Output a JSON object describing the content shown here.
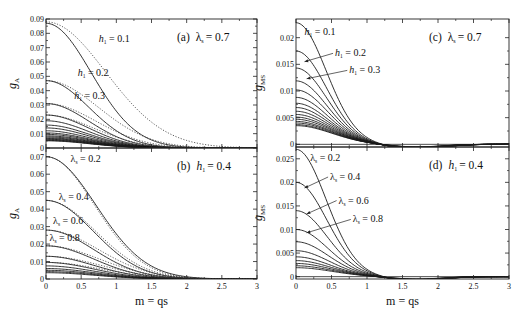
{
  "chart_data": [
    {
      "id": "a",
      "type": "line",
      "title": "(a)  λs = 0.7",
      "title_parts": {
        "tag": "(a)",
        "param": "λ",
        "sub": "s",
        "value": "= 0.7"
      },
      "ylabel": "g",
      "ylabel_sub": "A",
      "xlabel": "",
      "xlim": [
        0,
        3
      ],
      "ylim": [
        0,
        0.09
      ],
      "xticks": [
        0,
        0.5,
        1,
        1.5,
        2,
        2.5,
        3
      ],
      "yticks": [
        0,
        0.01,
        0.02,
        0.03,
        0.04,
        0.05,
        0.06,
        0.07,
        0.08,
        0.09
      ],
      "ytick_labels": [
        "0",
        "0.01",
        "0.02",
        "0.03",
        "0.04",
        "0.05",
        "0.06",
        "0.07",
        "0.08",
        "0.09"
      ],
      "show_xtick_labels": false,
      "grid": false,
      "family_param": "h1",
      "solid_series": [
        {
          "name": "h1 = 0.1",
          "y0": 0.087,
          "width": 0.95
        },
        {
          "name": "h1 = 0.2",
          "y0": 0.047,
          "width": 0.9
        },
        {
          "name": "h1 = 0.3",
          "y0": 0.031,
          "width": 0.9
        },
        {
          "name": "h1 = 0.4",
          "y0": 0.023,
          "width": 0.9
        },
        {
          "name": "h1 = 0.5",
          "y0": 0.019,
          "width": 0.9
        },
        {
          "name": "h1 = 0.6",
          "y0": 0.016,
          "width": 0.9
        },
        {
          "name": "h1 = 0.7",
          "y0": 0.014,
          "width": 0.9
        },
        {
          "name": "h1 = 0.8",
          "y0": 0.012,
          "width": 0.9
        },
        {
          "name": "h1 = 0.9",
          "y0": 0.0105,
          "width": 0.9
        },
        {
          "name": "h1 = 1.0",
          "y0": 0.0095,
          "width": 0.9
        },
        {
          "name": "h1 = 1.1",
          "y0": 0.0085,
          "width": 0.9
        },
        {
          "name": "h1 = 1.2",
          "y0": 0.0078,
          "width": 0.9
        },
        {
          "name": "h1 = 1.3",
          "y0": 0.0071,
          "width": 0.9
        },
        {
          "name": "h1 = 1.4",
          "y0": 0.0066,
          "width": 0.9
        },
        {
          "name": "h1 = 1.5",
          "y0": 0.0061,
          "width": 0.9
        },
        {
          "name": "h1 = 1.6",
          "y0": 0.0057,
          "width": 0.9
        },
        {
          "name": "h1 = 1.7",
          "y0": 0.0053,
          "width": 0.9
        },
        {
          "name": "h1 = 1.8",
          "y0": 0.005,
          "width": 0.9
        }
      ],
      "dotted_series": [
        {
          "name": "h1 = 0.1 (approx.)",
          "y0": 0.088,
          "width": 1.25
        },
        {
          "name": "h1 = 0.2 (approx.)",
          "y0": 0.047,
          "width": 1.1
        },
        {
          "name": "h1 = 0.3 (approx.)",
          "y0": 0.031,
          "width": 1.05
        },
        {
          "name": "h1 = 0.4 (approx.)",
          "y0": 0.023,
          "width": 1.0
        }
      ],
      "annotations": [
        {
          "text_main": "h",
          "text_sub": "1",
          "text_value": " = 0.1",
          "x": 0.75,
          "y": 0.074
        },
        {
          "text_main": "h",
          "text_sub": "1",
          "text_value": " = 0.2",
          "x": 0.45,
          "y": 0.05
        },
        {
          "text_main": "h",
          "text_sub": "1",
          "text_value": " = 0.3",
          "x": 0.4,
          "y": 0.034
        }
      ]
    },
    {
      "id": "b",
      "type": "line",
      "title": "(b)  h1 = 0.4",
      "title_parts": {
        "tag": "(b)",
        "param": "h",
        "sub": "1",
        "value": "= 0.4"
      },
      "ylabel": "g",
      "ylabel_sub": "A",
      "xlabel": "m = qs",
      "xlim": [
        0,
        3
      ],
      "ylim": [
        0,
        0.075
      ],
      "xticks": [
        0,
        0.5,
        1,
        1.5,
        2,
        2.5,
        3
      ],
      "xtick_labels": [
        "0",
        "0.5",
        "1",
        "1.5",
        "2",
        "2.5",
        "3"
      ],
      "yticks": [
        0,
        0.01,
        0.02,
        0.03,
        0.04,
        0.05,
        0.06,
        0.07
      ],
      "ytick_labels": [
        "0",
        "0.01",
        "0.02",
        "0.03",
        "0.04",
        "0.05",
        "0.06",
        "0.07"
      ],
      "show_xtick_labels": true,
      "grid": false,
      "family_param": "λs",
      "solid_series": [
        {
          "name": "λs = 0.2",
          "y0": 0.07,
          "width": 1.05
        },
        {
          "name": "λs = 0.4",
          "y0": 0.045,
          "width": 1.0
        },
        {
          "name": "λs = 0.6",
          "y0": 0.028,
          "width": 1.0
        },
        {
          "name": "λs = 0.8",
          "y0": 0.019,
          "width": 1.0
        },
        {
          "name": "λs = 1.0",
          "y0": 0.013,
          "width": 1.0
        },
        {
          "name": "λs = 1.2",
          "y0": 0.0095,
          "width": 1.0
        },
        {
          "name": "λs = 1.4",
          "y0": 0.0075,
          "width": 1.0
        },
        {
          "name": "λs = 1.6",
          "y0": 0.006,
          "width": 1.0
        },
        {
          "name": "λs = 1.8",
          "y0": 0.005,
          "width": 1.0
        },
        {
          "name": "λs = 2.0",
          "y0": 0.0042,
          "width": 1.0
        },
        {
          "name": "λs = 2.2",
          "y0": 0.0036,
          "width": 1.0
        }
      ],
      "dotted_series": [
        {
          "name": "λs = 0.2 (approx.)",
          "y0": 0.07,
          "width": 1.02
        },
        {
          "name": "λs = 0.4 (approx.)",
          "y0": 0.045,
          "width": 1.05
        },
        {
          "name": "λs = 0.6 (approx.)",
          "y0": 0.028,
          "width": 1.1
        },
        {
          "name": "λs = 0.8 (approx.)",
          "y0": 0.019,
          "width": 1.12
        },
        {
          "name": "λs = 1.0 (approx.)",
          "y0": 0.013,
          "width": 1.15
        },
        {
          "name": "λs = 1.2 (approx.)",
          "y0": 0.0095,
          "width": 1.15
        }
      ],
      "annotations": [
        {
          "text_main": "λ",
          "text_sub": "s",
          "text_value": " = 0.2",
          "x": 0.35,
          "y": 0.067
        },
        {
          "text_main": "λ",
          "text_sub": "s",
          "text_value": " = 0.4",
          "x": 0.18,
          "y": 0.0455
        },
        {
          "text_main": "λ",
          "text_sub": "s",
          "text_value": " = 0.6",
          "x": 0.1,
          "y": 0.0315
        },
        {
          "text_main": "λ",
          "text_sub": "s",
          "text_value": " = 0.8",
          "x": 0.05,
          "y": 0.0215
        }
      ]
    },
    {
      "id": "c",
      "type": "line",
      "title": "(c)  λs = 0.7",
      "title_parts": {
        "tag": "(c)",
        "param": "λ",
        "sub": "s",
        "value": "= 0.7"
      },
      "ylabel": "g",
      "ylabel_sub": "MS",
      "xlabel": "",
      "xlim": [
        0,
        3
      ],
      "ylim": [
        -0.0005,
        0.0235
      ],
      "xticks": [
        0,
        0.5,
        1,
        1.5,
        2,
        2.5,
        3
      ],
      "yticks": [
        0,
        0.005,
        0.01,
        0.015,
        0.02
      ],
      "ytick_labels": [
        "0",
        "0.005",
        "0.01",
        "0.015",
        "0.02"
      ],
      "show_xtick_labels": false,
      "grid": false,
      "family_param": "h1",
      "solid_series": [
        {
          "name": "h1 = 0.1",
          "y0": 0.0228
        },
        {
          "name": "h1 = 0.2",
          "y0": 0.0175
        },
        {
          "name": "h1 = 0.3",
          "y0": 0.0143
        },
        {
          "name": "h1 = 0.4",
          "y0": 0.0119
        },
        {
          "name": "h1 = 0.5",
          "y0": 0.0102
        },
        {
          "name": "h1 = 0.6",
          "y0": 0.0088
        },
        {
          "name": "h1 = 0.7",
          "y0": 0.0077
        },
        {
          "name": "h1 = 0.8",
          "y0": 0.0069
        },
        {
          "name": "h1 = 0.9",
          "y0": 0.0062
        },
        {
          "name": "h1 = 1.0",
          "y0": 0.0056
        },
        {
          "name": "h1 = 1.1",
          "y0": 0.0051
        },
        {
          "name": "h1 = 1.2",
          "y0": 0.0047
        },
        {
          "name": "h1 = 1.3",
          "y0": 0.0043
        },
        {
          "name": "h1 = 1.4",
          "y0": 0.004
        },
        {
          "name": "h1 = 1.5",
          "y0": 0.0037
        },
        {
          "name": "h1 = 1.6",
          "y0": 0.0035
        }
      ],
      "annotations": [
        {
          "text_main": "h",
          "text_sub": "1",
          "text_value": " = 0.1",
          "x": 0.12,
          "y": 0.0205,
          "arrow_to": null
        },
        {
          "text_main": "h",
          "text_sub": "1",
          "text_value": " = 0.2",
          "x": 0.55,
          "y": 0.0165,
          "arrow_to": [
            0.12,
            0.0155
          ]
        },
        {
          "text_main": "h",
          "text_sub": "1",
          "text_value": " = 0.3",
          "x": 0.75,
          "y": 0.0133,
          "arrow_to": [
            0.15,
            0.0123
          ]
        }
      ]
    },
    {
      "id": "d",
      "type": "line",
      "title": "(d)  h1 = 0.4",
      "title_parts": {
        "tag": "(d)",
        "param": "h",
        "sub": "1",
        "value": "= 0.4"
      },
      "ylabel": "g",
      "ylabel_sub": "MS",
      "xlabel": "m = qs",
      "xlim": [
        0,
        3
      ],
      "ylim": [
        -0.0005,
        0.0275
      ],
      "xticks": [
        0,
        0.5,
        1,
        1.5,
        2,
        2.5,
        3
      ],
      "xtick_labels": [
        "0",
        "0.5",
        "1",
        "1.5",
        "2",
        "2.5",
        "3"
      ],
      "yticks": [
        0,
        0.005,
        0.01,
        0.015,
        0.02,
        0.025
      ],
      "ytick_labels": [
        "0",
        "0.005",
        "0.01",
        "0.015",
        "0.02",
        "0.025"
      ],
      "show_xtick_labels": true,
      "grid": false,
      "family_param": "λs",
      "solid_series": [
        {
          "name": "λs = 0.2",
          "y0": 0.027
        },
        {
          "name": "λs = 0.4",
          "y0": 0.02
        },
        {
          "name": "λs = 0.6",
          "y0": 0.014
        },
        {
          "name": "λs = 0.8",
          "y0": 0.01
        },
        {
          "name": "λs = 1.0",
          "y0": 0.0074
        },
        {
          "name": "λs = 1.2",
          "y0": 0.0055
        },
        {
          "name": "λs = 1.4",
          "y0": 0.0042
        },
        {
          "name": "λs = 1.6",
          "y0": 0.0034
        },
        {
          "name": "λs = 1.8",
          "y0": 0.0028
        },
        {
          "name": "λs = 2.0",
          "y0": 0.0023
        },
        {
          "name": "λs = 2.2",
          "y0": 0.0019
        }
      ],
      "annotations": [
        {
          "text_main": "λ",
          "text_sub": "s",
          "text_value": " = 0.2",
          "x": 0.2,
          "y": 0.0245,
          "arrow_to": null
        },
        {
          "text_main": "λ",
          "text_sub": "s",
          "text_value": " = 0.4",
          "x": 0.48,
          "y": 0.0205,
          "arrow_to": [
            0.12,
            0.0188
          ]
        },
        {
          "text_main": "λ",
          "text_sub": "s",
          "text_value": " = 0.6",
          "x": 0.6,
          "y": 0.0155,
          "arrow_to": [
            0.15,
            0.0133
          ]
        },
        {
          "text_main": "λ",
          "text_sub": "s",
          "text_value": " = 0.8",
          "x": 0.8,
          "y": 0.0115,
          "arrow_to": [
            0.15,
            0.0093
          ]
        }
      ]
    }
  ]
}
